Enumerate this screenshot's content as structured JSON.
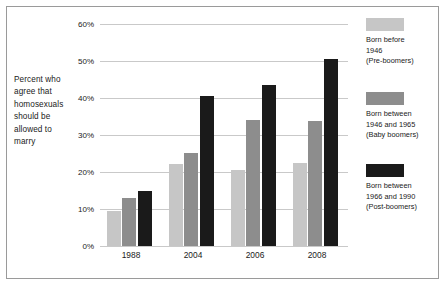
{
  "chart_data": {
    "type": "bar",
    "title": "",
    "subtitle": "",
    "xlabel": "",
    "ylabel": "Percent who agree that homosexuals should be allowed to marry",
    "ylim": [
      0,
      60
    ],
    "yticks": [
      0,
      10,
      20,
      30,
      40,
      50,
      60
    ],
    "ytick_labels": [
      "0%",
      "10%",
      "20%",
      "30%",
      "40%",
      "50%",
      "60%"
    ],
    "grid": true,
    "legend_position": "right",
    "categories": [
      "1988",
      "2004",
      "2006",
      "2008"
    ],
    "series": [
      {
        "name": "Born before 1946 (Pre-boomers)",
        "color": "#c6c6c6",
        "values": [
          9.5,
          22.2,
          20.6,
          22.5
        ]
      },
      {
        "name": "Born between 1946 and 1965 (Baby boomers)",
        "color": "#8d8d8d",
        "values": [
          13.0,
          25.2,
          34.0,
          33.9
        ]
      },
      {
        "name": "Born between 1966 and 1990 (Post-boomers)",
        "color": "#1a1a1a",
        "values": [
          14.8,
          40.5,
          43.5,
          50.5
        ]
      }
    ]
  },
  "axis_caption": {
    "lines": [
      "Percent who",
      "agree that",
      "homosexuals",
      "should be",
      "allowed to",
      "marry"
    ]
  },
  "yaxis": {
    "labels": [
      "60%",
      "50%",
      "40%",
      "30%",
      "20%",
      "10%",
      "0%"
    ]
  },
  "xaxis": {
    "labels": [
      "1988",
      "2004",
      "2006",
      "2008"
    ]
  },
  "legend": {
    "entries": [
      {
        "swatch_color": "#c6c6c6",
        "lines": [
          "Born before",
          "1946",
          "(Pre-boomers)"
        ]
      },
      {
        "swatch_color": "#8d8d8d",
        "lines": [
          "Born between",
          "1946 and 1965",
          "(Baby boomers)"
        ]
      },
      {
        "swatch_color": "#1a1a1a",
        "lines": [
          "Born between",
          "1966 and 1990",
          "(Post-boomers)"
        ]
      }
    ]
  },
  "colors": {
    "pre_boomers": "#c6c6c6",
    "baby_boomers": "#8d8d8d",
    "post_boomers": "#1a1a1a",
    "gridline": "#c9c9c9",
    "frame": "#9a9a9a",
    "text": "#1a1a1a",
    "background": "#ffffff"
  }
}
